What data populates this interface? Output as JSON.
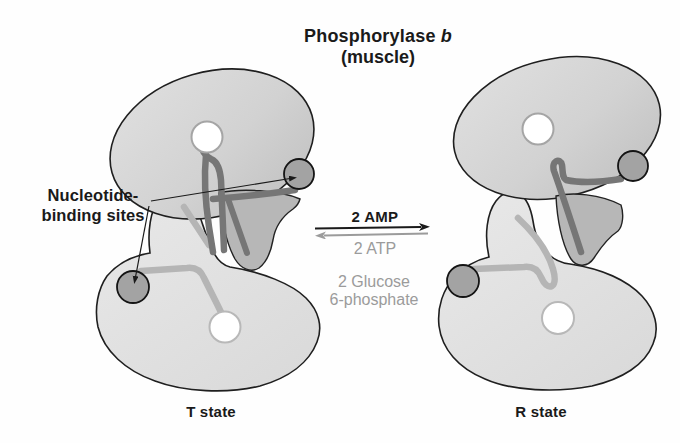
{
  "title": {
    "name": "Phosphorylase ",
    "isoform": "b",
    "subtitle": "(muscle)"
  },
  "binding_sites_label": {
    "line1": "Nucleotide-",
    "line2": "binding sites"
  },
  "reaction": {
    "forward": "2 AMP",
    "reverse": "2 ATP",
    "reverse_alt_line1": "2 Glucose",
    "reverse_alt_line2": "6-phosphate"
  },
  "states": {
    "left": "T state",
    "right": "R state"
  },
  "colors": {
    "outline": "#1f1f1f",
    "subunit_upper_fill": "#d4d4d4",
    "subunit_lower_fill": "#e5e5e5",
    "domain_dark_fill": "#b7b7b7",
    "ribbon_dark": "#767676",
    "ribbon_light": "#b5b5b5",
    "binding_site_fill": "#a3a3a3",
    "gray_text": "#9b9b9b",
    "black_text": "#1a1a1a"
  }
}
